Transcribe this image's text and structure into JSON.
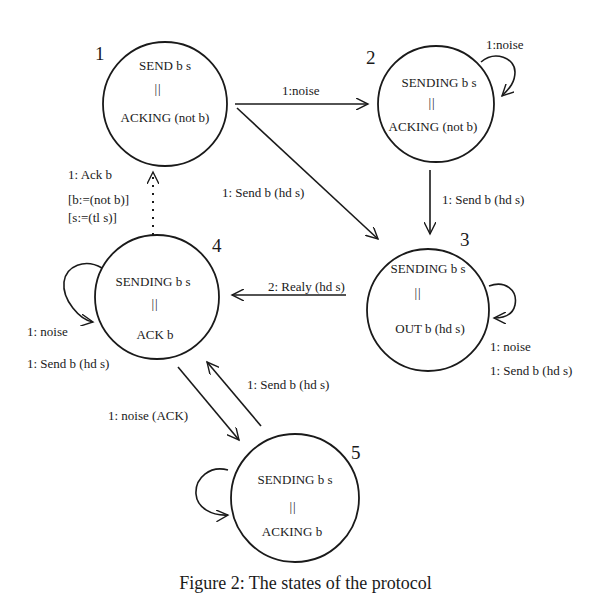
{
  "diagram": {
    "type": "state-transition",
    "states": [
      {
        "id": "1",
        "number": "1",
        "line1": "SEND b s",
        "sep": "||",
        "line2": "ACKING (not b)"
      },
      {
        "id": "2",
        "number": "2",
        "line1": "SENDING b s",
        "sep": "||",
        "line2": "ACKING (not b)"
      },
      {
        "id": "3",
        "number": "3",
        "line1": "SENDING b s",
        "sep": "||",
        "line2": "OUT b  (hd s)"
      },
      {
        "id": "4",
        "number": "4",
        "line1": "SENDING  b  s",
        "sep": "||",
        "line2": "ACK b"
      },
      {
        "id": "5",
        "number": "5",
        "line1": "SENDING b s",
        "sep": "||",
        "line2": "ACKING b"
      }
    ],
    "transitions": [
      {
        "from": "1",
        "to": "2",
        "label": "1:noise"
      },
      {
        "from": "1",
        "to": "3",
        "label": "1: Send b (hd s)"
      },
      {
        "from": "2",
        "to": "2",
        "label": "1:noise"
      },
      {
        "from": "2",
        "to": "3",
        "label": "1: Send b (hd s)"
      },
      {
        "from": "3",
        "to": "3",
        "label": "1: noise",
        "label2": "1: Send b (hd s)"
      },
      {
        "from": "3",
        "to": "4",
        "label": "2: Realy (hd s)"
      },
      {
        "from": "4",
        "to": "1",
        "label": "1: Ack b",
        "label2": "[b:=(not b)]",
        "label3": "[s:=(tl s)]",
        "style": "dotted"
      },
      {
        "from": "4",
        "to": "4",
        "label": "1: noise",
        "label2": "1: Send b (hd s)"
      },
      {
        "from": "4",
        "to": "5",
        "label": "1: noise (ACK)"
      },
      {
        "from": "5",
        "to": "4",
        "label": "1: Send b  (hd s)"
      },
      {
        "from": "5",
        "to": "5",
        "label": ""
      }
    ]
  },
  "caption": "Figure 2:  The states of the protocol"
}
